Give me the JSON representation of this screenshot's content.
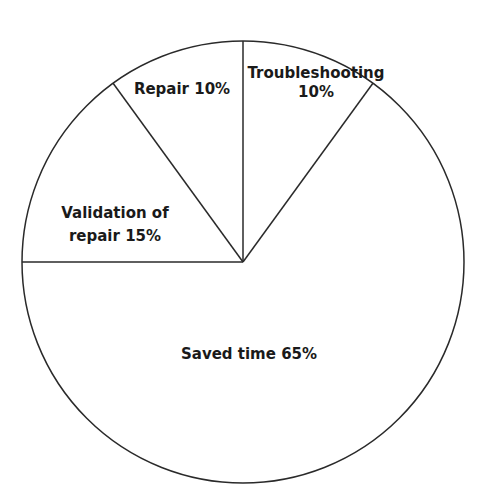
{
  "chart_data": {
    "type": "pie",
    "title": "",
    "categories": [
      "Troubleshooting",
      "Saved time",
      "Validation of repair",
      "Repair"
    ],
    "values": [
      10,
      65,
      15,
      10
    ],
    "unit": "%",
    "labels": [
      {
        "lines": [
          "Troubleshooting",
          "10%"
        ]
      },
      {
        "lines": [
          "Saved time 65%"
        ]
      },
      {
        "lines": [
          "Validation of",
          "repair 15%"
        ]
      },
      {
        "lines": [
          "Repair 10%"
        ]
      }
    ],
    "start_angle_deg_from_top": 0,
    "direction": "clockwise",
    "fill": "#ffffff",
    "stroke": "#2a2a2a",
    "legend": "none",
    "grid": false
  }
}
